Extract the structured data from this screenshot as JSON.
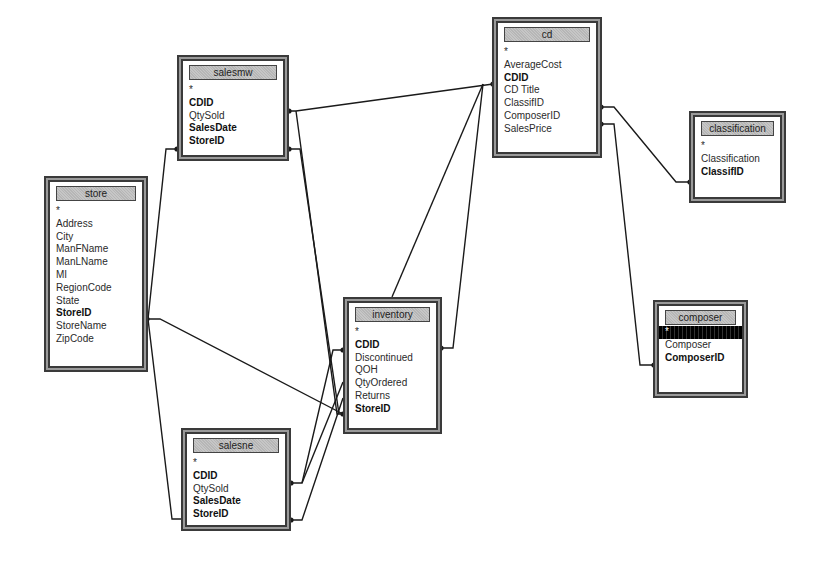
{
  "diagram": {
    "tables": [
      {
        "id": "salesmw",
        "name": "salesmw",
        "fields": [
          {
            "label": "*",
            "key": false
          },
          {
            "label": "CDID",
            "key": true
          },
          {
            "label": "QtySold",
            "key": false
          },
          {
            "label": "SalesDate",
            "key": true
          },
          {
            "label": "StoreID",
            "key": true
          }
        ]
      },
      {
        "id": "store",
        "name": "store",
        "fields": [
          {
            "label": "*",
            "key": false
          },
          {
            "label": "Address",
            "key": false
          },
          {
            "label": "City",
            "key": false
          },
          {
            "label": "ManFName",
            "key": false
          },
          {
            "label": "ManLName",
            "key": false
          },
          {
            "label": "MI",
            "key": false
          },
          {
            "label": "RegionCode",
            "key": false
          },
          {
            "label": "State",
            "key": false
          },
          {
            "label": "StoreID",
            "key": true
          },
          {
            "label": "StoreName",
            "key": false
          },
          {
            "label": "ZipCode",
            "key": false
          }
        ]
      },
      {
        "id": "cd",
        "name": "cd",
        "fields": [
          {
            "label": "*",
            "key": false
          },
          {
            "label": "AverageCost",
            "key": false
          },
          {
            "label": "CDID",
            "key": true
          },
          {
            "label": "CD Title",
            "key": false
          },
          {
            "label": "ClassifID",
            "key": false
          },
          {
            "label": "ComposerID",
            "key": false
          },
          {
            "label": "SalesPrice",
            "key": false
          }
        ]
      },
      {
        "id": "classification",
        "name": "classification",
        "fields": [
          {
            "label": "*",
            "key": false
          },
          {
            "label": "Classification",
            "key": false
          },
          {
            "label": "ClassifID",
            "key": true
          }
        ]
      },
      {
        "id": "composer",
        "name": "composer",
        "fields": [
          {
            "label": "*",
            "key": false,
            "selected": true
          },
          {
            "label": "Composer",
            "key": false
          },
          {
            "label": "ComposerID",
            "key": true
          }
        ]
      },
      {
        "id": "inventory",
        "name": "inventory",
        "fields": [
          {
            "label": "*",
            "key": false
          },
          {
            "label": "CDID",
            "key": true
          },
          {
            "label": "Discontinued",
            "key": false
          },
          {
            "label": "QOH",
            "key": false
          },
          {
            "label": "QtyOrdered",
            "key": false
          },
          {
            "label": "Returns",
            "key": false
          },
          {
            "label": "StoreID",
            "key": true
          }
        ]
      },
      {
        "id": "salesne",
        "name": "salesne",
        "fields": [
          {
            "label": "*",
            "key": false
          },
          {
            "label": "CDID",
            "key": true
          },
          {
            "label": "QtySold",
            "key": false
          },
          {
            "label": "SalesDate",
            "key": true
          },
          {
            "label": "StoreID",
            "key": true
          }
        ]
      }
    ],
    "relationships": [
      {
        "from": "salesmw.CDID",
        "to": "cd.CDID"
      },
      {
        "from": "salesmw.CDID",
        "to": "inventory.StoreID"
      },
      {
        "from": "salesmw.StoreID",
        "to": "store.StoreID"
      },
      {
        "from": "salesmw.StoreID",
        "to": "inventory.StoreID"
      },
      {
        "from": "store.StoreID",
        "to": "salesne.StoreID"
      },
      {
        "from": "store.StoreID",
        "to": "inventory.StoreID"
      },
      {
        "from": "cd.CDID",
        "to": "inventory.CDID"
      },
      {
        "from": "cd.CDID",
        "to": "inventory.title"
      },
      {
        "from": "cd.ClassifID",
        "to": "classification.ClassifID"
      },
      {
        "from": "cd.ComposerID",
        "to": "composer.ComposerID"
      },
      {
        "from": "salesne.CDID",
        "to": "inventory.CDID"
      },
      {
        "from": "salesne.CDID",
        "to": "inventory.QtyOrdered"
      },
      {
        "from": "salesne.StoreID",
        "to": "inventory.Returns"
      }
    ],
    "colors": {
      "line": "#1a1a1a",
      "frame": "#3a3a3a",
      "frame_fill": "#9a9a9a",
      "title_fill": "#bdbdbd",
      "selected_row": "#111111"
    }
  }
}
